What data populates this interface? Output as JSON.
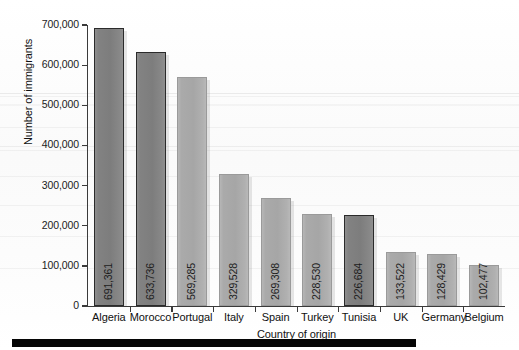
{
  "chart_data": {
    "type": "bar",
    "title": "",
    "xlabel": "Country of origin",
    "ylabel": "Number of immigrants",
    "categories": [
      "Algeria",
      "Morocco",
      "Portugal",
      "Italy",
      "Spain",
      "Turkey",
      "Tunisia",
      "UK",
      "Germany",
      "Belgium"
    ],
    "values": [
      691361,
      633736,
      569285,
      329528,
      269308,
      228530,
      226684,
      133522,
      128429,
      102477
    ],
    "value_labels": [
      "691,361",
      "633,736",
      "569,285",
      "329,528",
      "269,308",
      "228,530",
      "226,684",
      "133,522",
      "128,429",
      "102,477"
    ],
    "bar_styles": [
      "dark",
      "dark",
      "light",
      "light",
      "light",
      "light",
      "dark",
      "light",
      "light",
      "light"
    ],
    "ylim": [
      0,
      700000
    ],
    "ytick_values": [
      0,
      100000,
      200000,
      300000,
      400000,
      500000,
      600000,
      700000
    ],
    "ytick_labels": [
      "0",
      "100,000",
      "200,000",
      "300,000",
      "400,000",
      "500,000",
      "600,000",
      "700,000"
    ],
    "grid": false,
    "legend": "none",
    "value_label_orientation": "vertical-rotated-90",
    "colors": {
      "bar_dark_fill": "#828282",
      "bar_dark_border": "#2b2b2b",
      "bar_light_fill": "#aaaaaa",
      "bar_light_border": "#9a9a9a",
      "axis": "#3a3a3a",
      "text": "#111111",
      "background": "#fbfbfb",
      "footer_rule": "#050505"
    }
  }
}
